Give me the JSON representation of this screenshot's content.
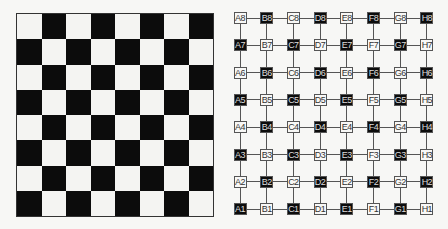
{
  "left_board": {
    "rows": 8,
    "cols": 8,
    "top_left_color": "white",
    "colors": {
      "light": "#f4f4f2",
      "dark": "#0c0c0c"
    }
  },
  "graph": {
    "columns": [
      "A",
      "B",
      "C",
      "D",
      "E",
      "F",
      "G",
      "H"
    ],
    "rows": [
      "8",
      "7",
      "6",
      "5",
      "4",
      "3",
      "2",
      "1"
    ],
    "node_grid": [
      [
        "A8",
        "B8",
        "C8",
        "D8",
        "E8",
        "F8",
        "G8",
        "H8"
      ],
      [
        "A7",
        "B7",
        "C7",
        "D7",
        "E7",
        "F7",
        "G7",
        "H7"
      ],
      [
        "A6",
        "B6",
        "C6",
        "D6",
        "E6",
        "F6",
        "G6",
        "H6"
      ],
      [
        "A5",
        "B5",
        "C5",
        "D5",
        "E5",
        "F5",
        "G5",
        "H5"
      ],
      [
        "A4",
        "B4",
        "C4",
        "D4",
        "E4",
        "F4",
        "G4",
        "H4"
      ],
      [
        "A3",
        "B3",
        "C3",
        "D3",
        "E3",
        "F3",
        "G3",
        "H3"
      ],
      [
        "A2",
        "B2",
        "C2",
        "D2",
        "E2",
        "F2",
        "G2",
        "H2"
      ],
      [
        "A1",
        "B1",
        "C1",
        "D1",
        "E1",
        "F1",
        "G1",
        "H1"
      ]
    ],
    "node_colors": [
      [
        "w",
        "b",
        "w",
        "b",
        "w",
        "b",
        "w",
        "b"
      ],
      [
        "b",
        "w",
        "b",
        "w",
        "b",
        "w",
        "b",
        "w"
      ],
      [
        "w",
        "b",
        "w",
        "b",
        "w",
        "b",
        "w",
        "b"
      ],
      [
        "b",
        "w",
        "b",
        "w",
        "b",
        "w",
        "b",
        "w"
      ],
      [
        "w",
        "b",
        "w",
        "b",
        "w",
        "b",
        "w",
        "b"
      ],
      [
        "b",
        "w",
        "b",
        "w",
        "b",
        "w",
        "b",
        "w"
      ],
      [
        "w",
        "b",
        "w",
        "b",
        "w",
        "b",
        "w",
        "b"
      ],
      [
        "b",
        "w",
        "b",
        "w",
        "b",
        "w",
        "b",
        "w"
      ]
    ],
    "edge_color": "#555555"
  }
}
